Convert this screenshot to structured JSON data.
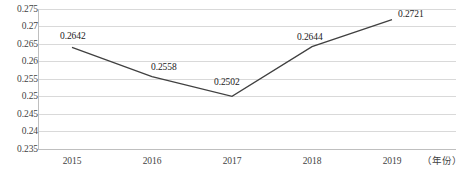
{
  "chart_data": {
    "type": "line",
    "title": "",
    "xlabel": "（年份）",
    "ylabel": "",
    "categories": [
      "2015",
      "2016",
      "2017",
      "2018",
      "2019"
    ],
    "values": [
      0.2642,
      0.2558,
      0.2502,
      0.2644,
      0.2721
    ],
    "point_labels": [
      "0.2642",
      "0.2558",
      "0.2502",
      "0.2644",
      "0.2721"
    ],
    "series": [
      {
        "name": "",
        "values": [
          0.2642,
          0.2558,
          0.2502,
          0.2644,
          0.2721
        ],
        "color": "#404040"
      }
    ],
    "ylim": [
      0.235,
      0.275
    ],
    "yticks": [
      0.275,
      0.27,
      0.265,
      0.26,
      0.255,
      0.25,
      0.245,
      0.24,
      0.235
    ],
    "ytick_labels": [
      "0.275",
      "0.27",
      "0.265",
      "0.26",
      "0.255",
      "0.25",
      "0.245",
      "0.24",
      "0.235"
    ],
    "grid": true,
    "grid_axis": "y",
    "legend": false,
    "legend_position": "none",
    "colors": {
      "line": "#404040",
      "grid": "#d9d9d9",
      "axis": "#bfbfbf",
      "tick_text": "#3f3f3f",
      "label_text": "#1a1a1a",
      "background": "#ffffff"
    }
  },
  "axes": {
    "y_ticks": [
      {
        "label": "0.275",
        "y": 9
      },
      {
        "label": "0.27",
        "y": 26
      },
      {
        "label": "0.265",
        "y": 44
      },
      {
        "label": "0.26",
        "y": 61
      },
      {
        "label": "0.255",
        "y": 79
      },
      {
        "label": "0.25",
        "y": 96
      },
      {
        "label": "0.245",
        "y": 114
      },
      {
        "label": "0.24",
        "y": 131
      },
      {
        "label": "0.235",
        "y": 149
      }
    ],
    "x_ticks": [
      {
        "label": "2015",
        "x": 72
      },
      {
        "label": "2016",
        "x": 152
      },
      {
        "label": "2017",
        "x": 232
      },
      {
        "label": "2018",
        "x": 312
      },
      {
        "label": "2019",
        "x": 392
      }
    ],
    "x_axis_title": "（年份）"
  },
  "data_labels": [
    {
      "text": "0.2642",
      "x": 60,
      "y": 31
    },
    {
      "text": "0.2558",
      "x": 151,
      "y": 62
    },
    {
      "text": "0.2502",
      "x": 214,
      "y": 77
    },
    {
      "text": "0.2644",
      "x": 297,
      "y": 32
    },
    {
      "text": "0.2721",
      "x": 398,
      "y": 9
    }
  ]
}
